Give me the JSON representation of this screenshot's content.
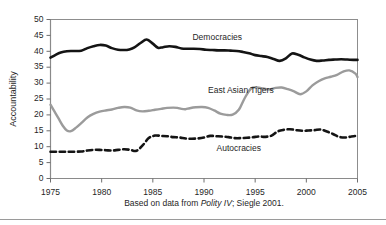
{
  "figure": {
    "caption_prefix": "Based on data from ",
    "caption_italic": "Polity IV",
    "caption_suffix": "; Siegle 2001."
  },
  "chart_data": {
    "type": "line",
    "title": "",
    "xlabel": "",
    "ylabel": "Accountability",
    "xlim": [
      1975,
      2005
    ],
    "ylim": [
      0,
      50
    ],
    "ytick_labels": [
      "50",
      "45",
      "40",
      "35",
      "30",
      "25",
      "20",
      "15",
      "10",
      "5",
      "0"
    ],
    "yticks": [
      50,
      45,
      40,
      35,
      30,
      25,
      20,
      15,
      10,
      5,
      0
    ],
    "xtick_labels": [
      "1975",
      "1980",
      "1985",
      "1990",
      "1995",
      "2000",
      "2005"
    ],
    "xticks": [
      1975,
      1980,
      1985,
      1990,
      1995,
      2000,
      2005
    ],
    "grid": false,
    "legend_position": "inline-annotations",
    "x": [
      1975,
      1976,
      1977,
      1978,
      1979,
      1980,
      1981,
      1982,
      1983,
      1984,
      1985,
      1986,
      1987,
      1988,
      1989,
      1990,
      1991,
      1992,
      1993,
      1994,
      1995,
      1996,
      1997,
      1998,
      1999,
      2000,
      2001,
      2002,
      2003,
      2004,
      2005
    ],
    "series": [
      {
        "name": "Democracies",
        "color": "#141414",
        "style": "solid",
        "width": 2.6,
        "label_x": 1991.3,
        "label_y": 44.2,
        "values": [
          38.0,
          39.6,
          40.1,
          40.2,
          41.6,
          42.0,
          41.0,
          40.4,
          40.4,
          41.0,
          43.7,
          41.1,
          41.6,
          40.8,
          40.8,
          40.5,
          40.3,
          40.3,
          40.1,
          39.4,
          38.8,
          38.2,
          37.0,
          37.6,
          39.3,
          38.6,
          37.0,
          37.3,
          37.5,
          37.3,
          37.3
        ]
      },
      {
        "name": "East Asian Tigers",
        "color": "#9b9b9b",
        "style": "solid",
        "width": 2.4,
        "label_x": 1993.6,
        "label_y": 27.5,
        "values": [
          23.2,
          17.8,
          14.9,
          17.0,
          19.8,
          21.0,
          21.6,
          22.4,
          21.1,
          21.5,
          21.9,
          22.3,
          22.1,
          21.7,
          22.5,
          22.5,
          21.6,
          20.0,
          20.3,
          24.1,
          28.6,
          28.6,
          28.1,
          27.6,
          26.5,
          29.7,
          31.1,
          32.5,
          34.0,
          32.1,
          31.9
        ]
      },
      {
        "name": "Autocracies",
        "color": "#141414",
        "style": "dashed",
        "width": 2.6,
        "label_x": 1993.4,
        "label_y": 9.2,
        "values": [
          8.4,
          8.4,
          8.4,
          8.4,
          8.8,
          9.0,
          8.8,
          9.2,
          8.7,
          11.8,
          13.5,
          13.3,
          12.9,
          12.5,
          12.6,
          13.4,
          13.2,
          12.9,
          12.7,
          12.7,
          13.2,
          13.1,
          14.8,
          15.5,
          15.0,
          15.2,
          15.5,
          14.4,
          13.1,
          12.9,
          13.5
        ]
      }
    ],
    "series_detail": {
      "Democracies": {
        "dense_x": [
          1975,
          1975.5,
          1976,
          1976.6,
          1977.2,
          1978,
          1978.6,
          1979.2,
          1979.8,
          1980.4,
          1981,
          1981.6,
          1982.2,
          1982.7,
          1983.2,
          1983.8,
          1984.4,
          1985,
          1985.5,
          1986,
          1986.6,
          1987.2,
          1987.8,
          1988.4,
          1989,
          1989.6,
          1990.2,
          1990.8,
          1991.4,
          1992,
          1992.6,
          1993.2,
          1993.8,
          1994.4,
          1995,
          1995.6,
          1996.2,
          1996.8,
          1997.4,
          1998,
          1998.6,
          1999.2,
          1999.8,
          2000.4,
          2001,
          2001.6,
          2002.2,
          2002.8,
          2003.4,
          2004,
          2004.6,
          2005
        ],
        "dense_y": [
          38.0,
          38.9,
          39.6,
          40.0,
          40.1,
          40.2,
          41.0,
          41.6,
          42.0,
          41.8,
          41.0,
          40.5,
          40.4,
          40.6,
          41.2,
          42.6,
          43.7,
          42.4,
          41.1,
          41.3,
          41.6,
          41.4,
          40.9,
          40.8,
          40.8,
          40.7,
          40.5,
          40.4,
          40.3,
          40.3,
          40.2,
          40.1,
          39.8,
          39.4,
          38.8,
          38.5,
          38.2,
          37.6,
          37.0,
          37.8,
          39.3,
          38.9,
          38.1,
          37.4,
          37.0,
          37.1,
          37.3,
          37.4,
          37.5,
          37.4,
          37.3,
          37.3
        ]
      },
      "East Asian Tigers": {
        "dense_x": [
          1975,
          1975.4,
          1975.8,
          1976.2,
          1976.6,
          1977,
          1977.5,
          1978,
          1978.6,
          1979.2,
          1979.8,
          1980.4,
          1981,
          1981.6,
          1982.2,
          1982.8,
          1983.4,
          1984,
          1984.6,
          1985.2,
          1985.8,
          1986.4,
          1987,
          1987.4,
          1987.8,
          1988.2,
          1988.6,
          1989.2,
          1989.8,
          1990.4,
          1991,
          1991.6,
          1992.2,
          1992.8,
          1993.4,
          1994,
          1994.6,
          1995.2,
          1995.8,
          1996.4,
          1997,
          1997.6,
          1998.2,
          1998.8,
          1999.4,
          2000,
          2000.6,
          2001.2,
          2001.8,
          2002.4,
          2003,
          2003.6,
          2004.2,
          2004.8,
          2005
        ],
        "dense_y": [
          23.2,
          21.0,
          18.8,
          16.6,
          15.1,
          14.9,
          16.0,
          17.4,
          19.2,
          20.3,
          21.0,
          21.4,
          21.7,
          22.2,
          22.5,
          22.3,
          21.4,
          21.1,
          21.3,
          21.6,
          21.9,
          22.2,
          22.3,
          22.2,
          21.9,
          21.8,
          22.1,
          22.4,
          22.5,
          22.2,
          21.4,
          20.4,
          20.0,
          20.1,
          21.6,
          25.4,
          28.3,
          28.6,
          28.3,
          28.0,
          28.5,
          28.6,
          28.1,
          27.4,
          26.5,
          27.4,
          29.3,
          30.6,
          31.5,
          32.0,
          32.6,
          33.6,
          34.0,
          33.0,
          31.9
        ]
      },
      "Autocracies": {
        "dense_x": [
          1975,
          1976,
          1977,
          1978,
          1978.6,
          1979.2,
          1979.8,
          1980.4,
          1981,
          1981.6,
          1982.2,
          1982.8,
          1983.4,
          1984,
          1984.6,
          1985.2,
          1985.8,
          1986.4,
          1987,
          1987.6,
          1988.2,
          1988.8,
          1989.4,
          1990,
          1990.6,
          1991.2,
          1991.8,
          1992.4,
          1993,
          1993.6,
          1994.2,
          1994.8,
          1995.4,
          1996,
          1996.6,
          1997.2,
          1997.8,
          1998.4,
          1999,
          1999.6,
          2000.2,
          2000.8,
          2001.4,
          2002,
          2002.6,
          2003.2,
          2003.8,
          2004.4,
          2005
        ],
        "dense_y": [
          8.4,
          8.4,
          8.4,
          8.5,
          8.8,
          9.0,
          9.0,
          8.9,
          8.8,
          9.0,
          9.2,
          9.0,
          8.7,
          10.4,
          12.7,
          13.5,
          13.4,
          13.3,
          13.0,
          12.9,
          12.6,
          12.5,
          12.6,
          12.9,
          13.4,
          13.3,
          13.2,
          13.0,
          12.7,
          12.7,
          12.8,
          13.0,
          13.2,
          13.1,
          13.5,
          14.8,
          15.3,
          15.5,
          15.2,
          15.0,
          15.1,
          15.2,
          15.4,
          14.8,
          14.0,
          13.1,
          12.9,
          13.2,
          13.5
        ]
      }
    }
  }
}
